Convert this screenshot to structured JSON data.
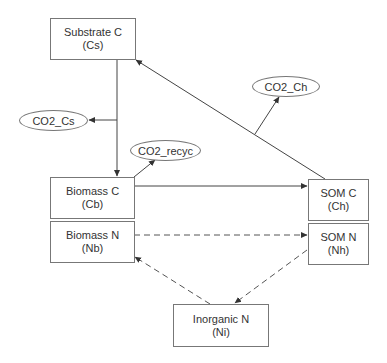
{
  "diagram": {
    "nodes": {
      "substrate_c": {
        "label": "Substrate C",
        "symbol": "(Cs)"
      },
      "biomass_c": {
        "label": "Biomass C",
        "symbol": "(Cb)"
      },
      "biomass_n": {
        "label": "Biomass N",
        "symbol": "(Nb)"
      },
      "som_c": {
        "label": "SOM C",
        "symbol": "(Ch)"
      },
      "som_n": {
        "label": "SOM N",
        "symbol": "(Nh)"
      },
      "inorganic_n": {
        "label": "Inorganic N",
        "symbol": "(Ni)"
      }
    },
    "outputs": {
      "co2_cs": {
        "label": "CO2_Cs"
      },
      "co2_recyc": {
        "label": "CO2_recyc"
      },
      "co2_ch": {
        "label": "CO2_Ch"
      }
    },
    "edges": [
      {
        "from": "Substrate C",
        "to": "Biomass C",
        "style": "solid"
      },
      {
        "from": "Substrate C",
        "to": "CO2_Cs",
        "style": "solid"
      },
      {
        "from": "Biomass C",
        "to": "CO2_recyc",
        "style": "solid"
      },
      {
        "from": "Biomass C",
        "to": "SOM C",
        "style": "solid"
      },
      {
        "from": "SOM C",
        "to": "Substrate C",
        "style": "solid"
      },
      {
        "from": "SOM C",
        "to": "CO2_Ch",
        "style": "solid"
      },
      {
        "from": "Biomass N",
        "to": "SOM N",
        "style": "dashed"
      },
      {
        "from": "SOM N",
        "to": "Inorganic N",
        "style": "dashed"
      },
      {
        "from": "Inorganic N",
        "to": "Biomass N",
        "style": "dashed"
      }
    ],
    "colors": {
      "line": "#444444",
      "border": "#777777",
      "text": "#333333"
    }
  }
}
